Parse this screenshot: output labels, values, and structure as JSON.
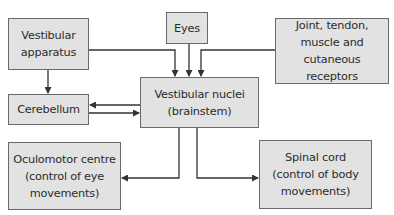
{
  "diagram": {
    "nodes": {
      "vestibular_apparatus": {
        "label": "Vestibular\napparatus"
      },
      "eyes": {
        "label": "Eyes"
      },
      "receptors": {
        "label": "Joint, tendon,\nmuscle and\ncutaneous receptors"
      },
      "vestibular_nuclei": {
        "label": "Vestibular nuclei\n(brainstem)"
      },
      "cerebellum": {
        "label": "Cerebellum"
      },
      "oculomotor": {
        "label": "Oculomotor centre\n(control of eye\nmovements)"
      },
      "spinal_cord": {
        "label": "Spinal cord\n(control of body\nmovements)"
      }
    },
    "edges": [
      {
        "from": "vestibular_apparatus",
        "to": "vestibular_nuclei"
      },
      {
        "from": "eyes",
        "to": "vestibular_nuclei"
      },
      {
        "from": "receptors",
        "to": "vestibular_nuclei"
      },
      {
        "from": "vestibular_apparatus",
        "to": "cerebellum"
      },
      {
        "from": "vestibular_nuclei",
        "to": "cerebellum"
      },
      {
        "from": "cerebellum",
        "to": "vestibular_nuclei"
      },
      {
        "from": "vestibular_nuclei",
        "to": "oculomotor"
      },
      {
        "from": "vestibular_nuclei",
        "to": "spinal_cord"
      }
    ],
    "colors": {
      "box_fill": "#e2e2e2",
      "box_border": "#6a6a6a",
      "line": "#333333",
      "text": "#2b2b2b"
    }
  }
}
